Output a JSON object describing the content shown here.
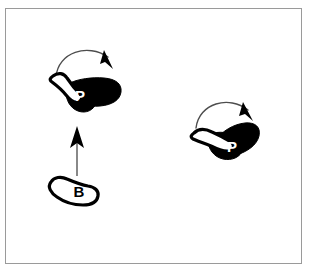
{
  "figure": {
    "background_color": "#ffffff",
    "frame_color": "#9a9a9a",
    "ink_color": "#000000",
    "arrow_color": "#4d4d4d",
    "canvas_width": 312,
    "canvas_height": 277
  },
  "objects": [
    {
      "id": "object-p-left",
      "label": "P",
      "label_color": "#ffffff",
      "shape": "boomerang",
      "white_arm_direction": "up-left",
      "black_arm_direction": "right",
      "position": {
        "x": 88,
        "y": 94
      }
    },
    {
      "id": "object-b-bottom",
      "label": "B",
      "label_color": "#000000",
      "shape": "elongated-blob",
      "fill": "white",
      "outline": "#000000",
      "position": {
        "x": 72,
        "y": 191
      }
    },
    {
      "id": "object-p-right",
      "label": "P",
      "label_color": "#ffffff",
      "shape": "boomerang",
      "white_arm_direction": "left",
      "black_arm_direction": "up-right",
      "position": {
        "x": 233,
        "y": 140
      }
    }
  ],
  "arrows": [
    {
      "id": "rotation-arrow-left",
      "type": "curved-arc",
      "direction": "clockwise",
      "head_direction": "down-right",
      "near_object": "object-p-left"
    },
    {
      "id": "translation-arrow",
      "type": "straight",
      "direction": "up",
      "from_object": "object-b-bottom",
      "to_object": "object-p-left"
    },
    {
      "id": "rotation-arrow-right",
      "type": "curved-arc",
      "direction": "clockwise",
      "head_direction": "down-right",
      "near_object": "object-p-right"
    }
  ]
}
